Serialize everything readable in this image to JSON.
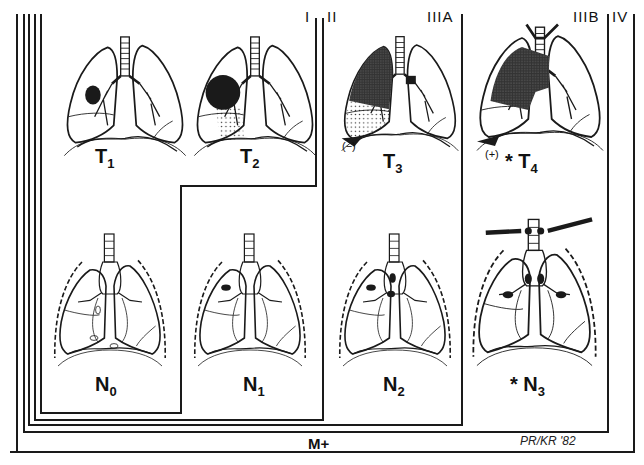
{
  "stages": [
    {
      "id": "I",
      "label": "I"
    },
    {
      "id": "II",
      "label": "II"
    },
    {
      "id": "IIIA",
      "label": "IIIA"
    },
    {
      "id": "IIIB",
      "label": "IIIB"
    },
    {
      "id": "IV",
      "label": "IV"
    }
  ],
  "panels": {
    "t1": {
      "base": "T",
      "sub": "1"
    },
    "t2": {
      "base": "T",
      "sub": "2"
    },
    "t3": {
      "base": "T",
      "sub": "3",
      "note": "(−)"
    },
    "t4": {
      "base": "T",
      "sub": "4",
      "note": "(+)",
      "marker": "*"
    },
    "n0": {
      "base": "N",
      "sub": "0"
    },
    "n1": {
      "base": "N",
      "sub": "1"
    },
    "n2": {
      "base": "N",
      "sub": "2"
    },
    "n3": {
      "base": "N",
      "sub": "3",
      "marker": "*"
    }
  },
  "metastasis_label": "M+",
  "signature": "PR/KR '82",
  "colors": {
    "ink": "#1a1a1a",
    "background": "#ffffff"
  }
}
